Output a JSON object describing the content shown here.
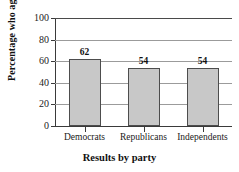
{
  "chart_data": {
    "type": "bar",
    "title": "",
    "categories": [
      "Democrats",
      "Republicans",
      "Independents"
    ],
    "values": [
      62,
      54,
      54
    ],
    "data_labels": [
      "62",
      "54",
      "54"
    ],
    "xlabel": "Results by party",
    "ylabel": "Percentage who agree",
    "ylim": [
      0,
      100
    ],
    "yticks": [
      0,
      20,
      40,
      60,
      80,
      100
    ],
    "ytick_labels": [
      "0",
      "20",
      "40",
      "60",
      "80",
      "100"
    ],
    "grid": true,
    "legend": false,
    "bar_color": "#c8c8c8",
    "bar_edge_color": "#4d4d4d",
    "gridline_color": "#9b9b9b",
    "axis_color": "#3a3a3a",
    "background_color": "#ffffff"
  }
}
